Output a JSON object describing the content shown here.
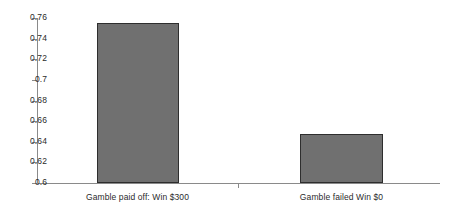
{
  "chart_data": {
    "type": "bar",
    "title": "",
    "subtitle": "",
    "xlabel": "",
    "ylabel": "",
    "categories": [
      "Gamble paid off: Win $300",
      "Gamble failed Win $0"
    ],
    "values": [
      0.755,
      0.648
    ],
    "ylim": [
      0.6,
      0.76
    ],
    "yticks": [
      "0.6",
      "0.62",
      "0.64",
      "0.66",
      "0.68",
      "0.7",
      "0.72",
      "0.74",
      "0.76"
    ],
    "ytick_values": [
      0.6,
      0.62,
      0.64,
      0.66,
      0.68,
      0.7,
      0.72,
      0.74,
      0.76
    ],
    "grid": false,
    "legend": null,
    "legend_position": "none",
    "colors": {
      "bar_fill": "#707070",
      "bar_border": "#2e2e2e",
      "axis": "#8a8a8a",
      "text": "#2b2b2b",
      "background": "#ffffff"
    }
  }
}
